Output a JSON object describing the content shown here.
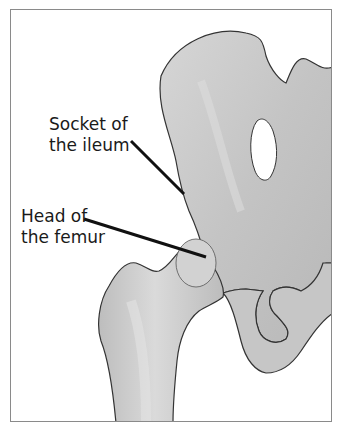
{
  "figure": {
    "labels": [
      {
        "id": "socket",
        "text": "Socket of\nthe ileum"
      },
      {
        "id": "head",
        "text": "Head of\nthe femur"
      }
    ]
  },
  "colors": {
    "bone_fill": "#c9c9c9",
    "bone_light": "#dedede",
    "bone_shadow": "#aaaaaa",
    "outline": "#333333",
    "leader_line": "#111111",
    "frame_border": "#8a8a8a"
  }
}
